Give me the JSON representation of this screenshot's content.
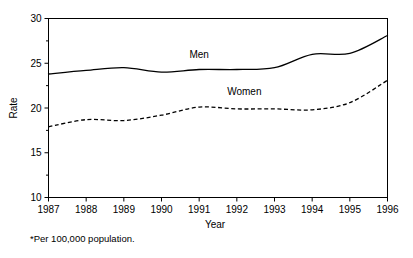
{
  "chart_data": {
    "type": "line",
    "title": "",
    "subtitle": "",
    "xlabel": "Year",
    "ylabel": "Rate",
    "footnote": "*Per 100,000 population.",
    "x": [
      1987,
      1988,
      1989,
      1990,
      1991,
      1992,
      1993,
      1994,
      1995,
      1996
    ],
    "categories": [
      "1987",
      "1988",
      "1989",
      "1990",
      "1991",
      "1992",
      "1993",
      "1994",
      "1995",
      "1996"
    ],
    "xlim": [
      1987,
      1996
    ],
    "ylim": [
      10,
      30
    ],
    "y_ticks": [
      10,
      15,
      20,
      25,
      30
    ],
    "y_tick_labels": [
      "10",
      "15",
      "20",
      "25",
      "30"
    ],
    "y_minor_ticks": [
      12.5,
      17.5,
      22.5,
      27.5
    ],
    "grid": false,
    "legend": "inline-labels",
    "series": [
      {
        "name": "Men",
        "style": "solid",
        "color": "#000000",
        "label_x": 1991.0,
        "label_y": 25.6,
        "values": [
          23.8,
          24.2,
          24.5,
          24.0,
          24.3,
          24.3,
          24.5,
          26.0,
          26.1,
          28.1
        ]
      },
      {
        "name": "Women",
        "style": "dashed",
        "color": "#000000",
        "label_x": 1992.2,
        "label_y": 21.4,
        "values": [
          17.9,
          18.7,
          18.6,
          19.2,
          20.1,
          19.9,
          19.9,
          19.8,
          20.6,
          23.1
        ]
      }
    ]
  },
  "axes": {
    "y_axis_title": "Rate",
    "x_axis_title": "Year"
  },
  "labels": {
    "men": "Men",
    "women": "Women"
  },
  "footnote": {
    "text": "*Per 100,000 population."
  }
}
